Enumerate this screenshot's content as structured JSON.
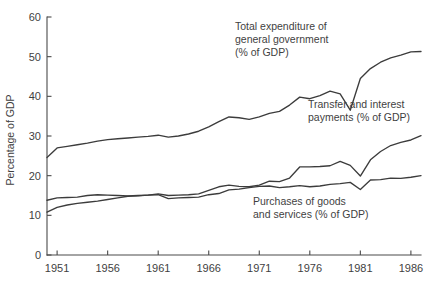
{
  "chart_data": {
    "type": "line",
    "title": "",
    "subtitle": "",
    "xlabel": "",
    "ylabel": "Percentage of GDP",
    "xlim": [
      1950,
      1987
    ],
    "ylim": [
      0,
      60
    ],
    "grid": false,
    "legend_position": "inline-annotations",
    "x_ticks": [
      "1951",
      "1956",
      "1961",
      "1966",
      "1971",
      "1976",
      "1981",
      "1986"
    ],
    "x_tick_values": [
      1951,
      1956,
      1961,
      1966,
      1971,
      1976,
      1981,
      1986
    ],
    "y_ticks": [
      "0",
      "10",
      "20",
      "30",
      "40",
      "50",
      "60"
    ],
    "y_tick_values": [
      0,
      10,
      20,
      30,
      40,
      50,
      60
    ],
    "x": [
      1950,
      1951,
      1952,
      1953,
      1954,
      1955,
      1956,
      1957,
      1958,
      1959,
      1960,
      1961,
      1962,
      1963,
      1964,
      1965,
      1966,
      1967,
      1968,
      1969,
      1970,
      1971,
      1972,
      1973,
      1974,
      1975,
      1976,
      1977,
      1978,
      1979,
      1980,
      1981,
      1982,
      1983,
      1984,
      1985,
      1986,
      1987
    ],
    "series": [
      {
        "name": "Total expenditure of general government (% of GDP)",
        "label_short": "Total expenditure of general government",
        "unit": "% of GDP",
        "values": [
          24.6,
          27.0,
          27.4,
          27.8,
          28.2,
          28.7,
          29.1,
          29.3,
          29.5,
          29.7,
          29.9,
          30.2,
          29.7,
          30.0,
          30.5,
          31.2,
          32.3,
          33.6,
          34.8,
          34.6,
          34.2,
          34.8,
          35.7,
          36.2,
          37.8,
          39.8,
          39.4,
          40.2,
          41.3,
          40.6,
          36.5,
          44.5,
          47.0,
          48.6,
          49.7,
          50.4,
          51.2,
          51.3
        ],
        "has_break": true,
        "break_year": 1980
      },
      {
        "name": "Transfer and interest payments (% of GDP)",
        "label_short": "Transfer and interest payments",
        "unit": "% of GDP",
        "values": [
          10.8,
          12.0,
          12.6,
          13.0,
          13.3,
          13.6,
          14.0,
          14.4,
          14.8,
          14.9,
          15.1,
          15.4,
          15.0,
          15.1,
          15.2,
          15.4,
          16.3,
          17.2,
          17.6,
          17.3,
          17.2,
          17.6,
          18.6,
          18.5,
          19.4,
          22.2,
          22.2,
          22.3,
          22.5,
          23.6,
          22.6,
          19.9,
          24.0,
          26.1,
          27.6,
          28.4,
          29.0,
          30.1
        ],
        "has_break": true,
        "break_year": 1980
      },
      {
        "name": "Purchases of goods and services (% of GDP)",
        "label_short": "Purchases of goods and services",
        "unit": "% of GDP",
        "values": [
          13.8,
          14.4,
          14.5,
          14.6,
          15.0,
          15.2,
          15.1,
          15.0,
          14.9,
          15.0,
          15.1,
          15.2,
          14.2,
          14.4,
          14.5,
          14.6,
          15.2,
          15.5,
          16.4,
          16.6,
          17.0,
          17.3,
          17.4,
          17.0,
          17.2,
          17.5,
          17.2,
          17.4,
          17.8,
          18.0,
          18.3,
          16.5,
          18.9,
          19.0,
          19.4,
          19.3,
          19.6,
          20.0
        ],
        "has_break": true,
        "break_year": 1980
      }
    ],
    "annotations": [
      {
        "id": "annotation-total-expenditure",
        "lines": [
          "Total expenditure of",
          "general government",
          "(% of GDP)"
        ]
      },
      {
        "id": "annotation-transfer-interest",
        "lines": [
          "Transfer and interest",
          "payments (% of GDP)"
        ]
      },
      {
        "id": "annotation-purchases",
        "lines": [
          "Purchases of goods",
          "and services (% of GDP)"
        ]
      }
    ],
    "colors": {
      "line": "#3c3c3c",
      "axis": "#4a4a4a",
      "text": "#3f3f3f",
      "background": "#ffffff"
    }
  }
}
